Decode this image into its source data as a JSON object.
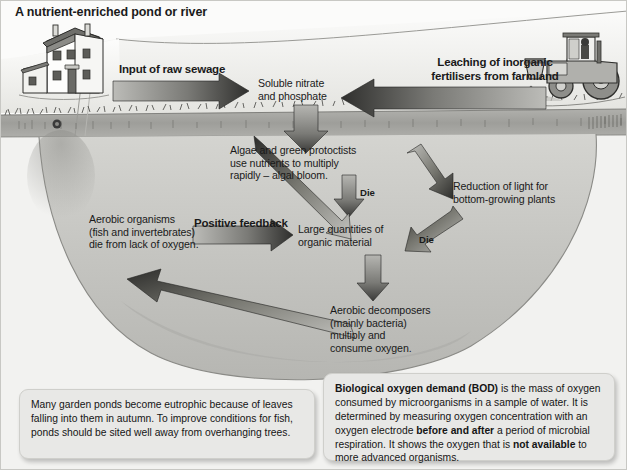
{
  "figure": {
    "title": "A nutrient-enriched pond or river",
    "colors": {
      "sky": "#f4f4f2",
      "land": "#e9e9e6",
      "soil_band": "#a8a8a4",
      "water": "#cfcfcb",
      "water_deep": "#bdbdb9",
      "arrow_dark": "#3a3a3a",
      "arrow_light": "#b4b4b0",
      "note_bg": "#e8e8e6",
      "text": "#1a1a1a"
    }
  },
  "scene": {
    "house_label": "farmhouse-illustration",
    "tractor_label": "tractor-spreading-fertiliser-illustration",
    "grass_label": "grass-bank",
    "pond_label": "pond-water-body"
  },
  "arrows": {
    "sewage": {
      "label": "Input of raw sewage",
      "direction": "right"
    },
    "leaching": {
      "label": "Leaching of inorganic\nfertilisers from farmland",
      "direction": "left"
    },
    "positive_feedback": {
      "label": "Positive feedback",
      "direction": "right"
    },
    "die_upper": {
      "label": "Die",
      "direction": "down"
    },
    "die_right": {
      "label": "Die",
      "direction": "down-left"
    },
    "nutrients_down": {
      "label": "",
      "direction": "down"
    },
    "bloom_to_light": {
      "label": "",
      "direction": "down-right"
    },
    "organic_to_decomposers": {
      "label": "",
      "direction": "down"
    },
    "decomposers_to_aerobic": {
      "label": "",
      "direction": "up-left"
    },
    "aerobic_to_organic": {
      "label": "",
      "direction": "down-right"
    }
  },
  "nodes": {
    "nitrate": "Soluble nitrate\nand phosphate",
    "algae": "Algae and green protoctists\nuse nutrients to multiply\nrapidly – algal bloom.",
    "light": "Reduction of light for\nbottom-growing plants",
    "organic": "Large quantities of\norganic material",
    "aerobic": "Aerobic organisms\n(fish and invertebrates)\ndie from lack of oxygen.",
    "decomposers": "Aerobic decomposers\n(mainly bacteria)\nmultiply and\nconsume oxygen."
  },
  "notes": {
    "left": {
      "text": "Many garden ponds become eutrophic because of leaves falling into them in autumn. To improve conditions for fish, ponds should be sited well away from overhanging trees."
    },
    "right": {
      "bold_lead": "Biological oxygen demand (BOD)",
      "part1": " is the mass of oxygen consumed by microorganisms in a sample of water. It is determined by measuring oxygen concentration with an oxygen electrode ",
      "bold_mid": "before and after",
      "part2": " a period of microbial respiration. It shows the oxygen that is ",
      "bold_end": "not available",
      "part3": " to more advanced organisms."
    }
  }
}
